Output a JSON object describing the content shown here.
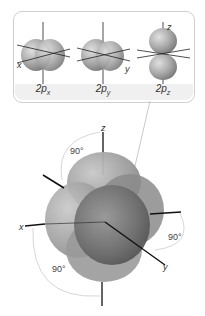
{
  "figure": {
    "orbitals": [
      {
        "id": "2px",
        "label_main": "2p",
        "label_sub": "x",
        "axis_label": "x"
      },
      {
        "id": "2py",
        "label_main": "2p",
        "label_sub": "y",
        "axis_label": "y"
      },
      {
        "id": "2pz",
        "label_main": "2p",
        "label_sub": "z",
        "axis_label": "z"
      }
    ],
    "combined": {
      "axes": {
        "x": "x",
        "y": "y",
        "z": "z"
      },
      "angles": [
        "90°",
        "90°",
        "90°"
      ]
    }
  },
  "colors": {
    "lobe_light": "#c9c9c9",
    "lobe_dark": "#6e6e6e",
    "axis": "#111111",
    "connector": "#bbbbbb",
    "panel_border": "#cfcfcf"
  }
}
